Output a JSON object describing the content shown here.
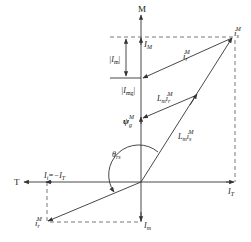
{
  "axes": {
    "vertical": "M",
    "horizontal": "T"
  },
  "labels": {
    "is_main": "i",
    "is_main_sub": "s",
    "is_main_sup": "M",
    "IM": "I",
    "IM_sub": "M",
    "ir_upper": "i",
    "ir_upper_sub": "r",
    "ir_upper_sup": "M",
    "Im_abs": "|I",
    "Im_abs_sub": "m",
    "Im_abs_end": "|",
    "Img_abs": "|I",
    "Img_abs_sub": "mg",
    "Img_abs_end": "|",
    "Lm_ir": "L",
    "Lm_ir_m": "m",
    "Lm_ir_i": "i",
    "Lm_ir_sub": "r",
    "Lm_ir_sup": "M",
    "psi": "ψ",
    "psi_sub": "g",
    "psi_sup": "M",
    "Lm_is": "L",
    "Lm_is_m": "m",
    "Lm_is_i": "i",
    "Lm_is_sub": "s",
    "Lm_is_sup": "M",
    "theta": "θ",
    "theta_sub": "rs",
    "It_eq": "I",
    "It_eq_sub": "t",
    "It_eq_rhs": "=−I",
    "It_eq_rhs_sub": "T",
    "IT": "I",
    "IT_sub": "T",
    "ir_lower": "i",
    "ir_lower_sub": "r",
    "ir_lower_sup": "M",
    "Im_bottom": "I",
    "Im_bottom_sub": "m"
  }
}
